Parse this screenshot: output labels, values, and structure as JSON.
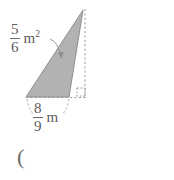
{
  "figure": {
    "background_color": "#ffffff",
    "shape": {
      "name": "triangle",
      "fill_color": "#b2b2b2",
      "stroke_color": "#8c8c8c",
      "vertices": [
        {
          "x": 26,
          "y": 97
        },
        {
          "x": 83,
          "y": 10
        },
        {
          "x": 69,
          "y": 97
        }
      ]
    },
    "guides": {
      "stroke_color": "#9a9a9a",
      "vertical_dashed": {
        "x": 85,
        "y1": 10,
        "y2": 97
      },
      "horizontal_dashed": {
        "y": 97,
        "x1": 26,
        "x2": 86
      },
      "right_angle_marker": {
        "x": 77,
        "y": 88,
        "size": 8
      },
      "area_leader": {
        "from_x": 54,
        "from_y": 41,
        "to_x": 61,
        "to_y": 58
      },
      "base_leader_left": {
        "from_x": 27,
        "from_y": 99,
        "to_x": 33,
        "to_y": 114
      },
      "base_leader_right": {
        "from_x": 69,
        "from_y": 99,
        "to_x": 62,
        "to_y": 114
      }
    },
    "labels": {
      "area": {
        "numerator": "5",
        "denominator": "6",
        "unit": "m",
        "exponent": "2",
        "full_text": "5/6 m²"
      },
      "base": {
        "numerator": "8",
        "denominator": "9",
        "unit": "m",
        "exponent": "",
        "full_text": "8/9 m"
      },
      "stray": {
        "text": "("
      }
    }
  }
}
